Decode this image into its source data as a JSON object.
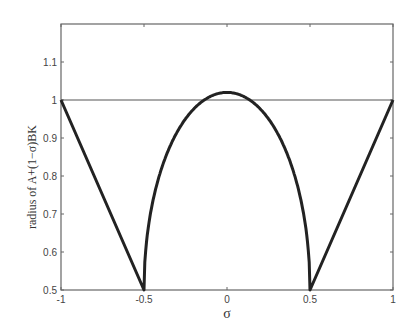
{
  "chart_data": {
    "type": "line",
    "title": "",
    "xlabel": "σ",
    "ylabel": "radius of A+(1−σ)BK",
    "xlim": [
      -1,
      1
    ],
    "ylim": [
      0.5,
      1.2
    ],
    "xticks": [
      -1,
      -0.5,
      0,
      0.5,
      1
    ],
    "xtick_labels": [
      "-1",
      "-0.5",
      "0",
      "0.5",
      "1"
    ],
    "yticks": [
      0.5,
      0.6,
      0.7,
      0.8,
      0.9,
      1,
      1.1
    ],
    "ytick_labels": [
      "0.5",
      "0.6",
      "0.7",
      "0.8",
      "0.9",
      "1",
      "1.1"
    ],
    "grid": false,
    "legend": null,
    "series": [
      {
        "name": "radius curve",
        "style": "thick dark line",
        "x": [
          -1,
          -0.5,
          -0.5,
          -0.45,
          -0.4,
          -0.3,
          -0.2,
          -0.1,
          0,
          0.1,
          0.2,
          0.3,
          0.4,
          0.45,
          0.5,
          0.5,
          1
        ],
        "y": [
          1.0,
          0.5,
          0.5,
          0.727,
          0.812,
          0.916,
          0.977,
          1.009,
          1.02,
          1.009,
          0.977,
          0.916,
          0.812,
          0.727,
          0.5,
          0.5,
          1.0
        ]
      },
      {
        "name": "reference line y=1",
        "style": "thin horizontal line",
        "x": [
          -1,
          1
        ],
        "y": [
          1,
          1
        ]
      }
    ]
  }
}
